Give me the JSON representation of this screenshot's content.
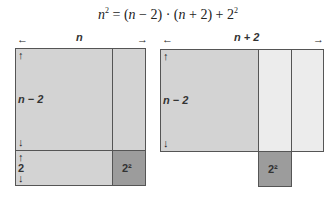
{
  "formula": {
    "lhs": "n",
    "lhs_exp": "2",
    "eq": " = (",
    "a": "n",
    "a_rest": " − 2) · (",
    "b": "n",
    "b_rest": " + 2) + 2",
    "rhs_exp": "2"
  },
  "left_figure": {
    "width_label": "n",
    "height_label_main": "n − 2",
    "height_label_small": "2",
    "corner_label": "2²"
  },
  "right_figure": {
    "width_label": "n + 2",
    "height_label_main": "n − 2",
    "moved_label": "2²"
  },
  "arrows": {
    "left": "←",
    "right": "→",
    "up": "↑",
    "down": "↓"
  },
  "colors": {
    "medium": "#d3d3d3",
    "light": "#ececec",
    "dark": "#9c9c9c",
    "border": "#555555"
  }
}
